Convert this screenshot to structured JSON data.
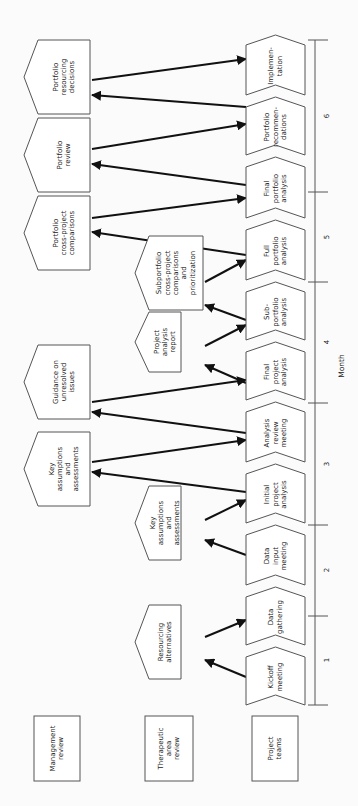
{
  "rows": [
    {
      "label_lines": [
        "Management",
        "review"
      ],
      "box": {
        "x": 34,
        "y": 716,
        "w": 46,
        "h": 65
      }
    },
    {
      "label_lines": [
        "Therapeutic",
        "area",
        "review"
      ],
      "box": {
        "x": 145,
        "y": 716,
        "w": 48,
        "h": 65
      }
    },
    {
      "label_lines": [
        "Project",
        "teams"
      ],
      "box": {
        "x": 252,
        "y": 716,
        "w": 46,
        "h": 65
      }
    }
  ],
  "steps": [
    {
      "lines": [
        "Kickoff",
        "meeting"
      ],
      "y0": 645,
      "y1": 705
    },
    {
      "lines": [
        "Data",
        "gathering"
      ],
      "y0": 585,
      "y1": 645
    },
    {
      "lines": [
        "Data",
        "input",
        "meeting"
      ],
      "y0": 523,
      "y1": 585
    },
    {
      "lines": [
        "Initial",
        "project",
        "analysis"
      ],
      "y0": 462,
      "y1": 523
    },
    {
      "lines": [
        "Analysis",
        "review",
        "meeting"
      ],
      "y0": 400,
      "y1": 462
    },
    {
      "lines": [
        "Final",
        "project",
        "analysis"
      ],
      "y0": 340,
      "y1": 400
    },
    {
      "lines": [
        "Sub-",
        "portfolio",
        "analysis"
      ],
      "y0": 280,
      "y1": 340
    },
    {
      "lines": [
        "Full",
        "portfolio",
        "analysis"
      ],
      "y0": 218,
      "y1": 280
    },
    {
      "lines": [
        "Final",
        "portfolio",
        "analysis"
      ],
      "y0": 155,
      "y1": 218
    },
    {
      "lines": [
        "Portfolio",
        "recommen-",
        "dations"
      ],
      "y0": 95,
      "y1": 155
    },
    {
      "lines": [
        "Implemen-",
        "tation"
      ],
      "y0": 33,
      "y1": 95
    }
  ],
  "outputs": [
    {
      "lines": [
        "Resourcing",
        "alternatives"
      ],
      "x": 135,
      "y": 605,
      "w": 46,
      "h": 74
    },
    {
      "lines": [
        "Key",
        "assumptions",
        "and",
        "assessments"
      ],
      "x": 135,
      "y": 486,
      "w": 46,
      "h": 74
    },
    {
      "lines": [
        "Key",
        "assumptions",
        "and",
        "assessments"
      ],
      "x": 24,
      "y": 432,
      "w": 66,
      "h": 74
    },
    {
      "lines": [
        "Guidance on",
        "unresolved",
        "issues"
      ],
      "x": 24,
      "y": 345,
      "w": 66,
      "h": 74
    },
    {
      "lines": [
        "Project",
        "analysis",
        "report"
      ],
      "x": 135,
      "y": 312,
      "w": 46,
      "h": 60
    },
    {
      "lines": [
        "Subportfolio",
        "cross-project",
        "comparisons",
        "and",
        "prioritization"
      ],
      "x": 135,
      "y": 236,
      "w": 68,
      "h": 74
    },
    {
      "lines": [
        "Portfolio",
        "cross-project",
        "comparisons"
      ],
      "x": 24,
      "y": 196,
      "w": 66,
      "h": 74
    },
    {
      "lines": [
        "Portfolio",
        "review"
      ],
      "x": 24,
      "y": 118,
      "w": 66,
      "h": 74
    },
    {
      "lines": [
        "Portfolio",
        "resourcing",
        "decisions"
      ],
      "x": 24,
      "y": 40,
      "w": 66,
      "h": 74
    }
  ],
  "arrows": [
    {
      "x1": 246,
      "y1": 677,
      "x2": 205,
      "y2": 660
    },
    {
      "x1": 205,
      "y1": 637,
      "x2": 246,
      "y2": 620
    },
    {
      "x1": 246,
      "y1": 555,
      "x2": 205,
      "y2": 540
    },
    {
      "x1": 205,
      "y1": 520,
      "x2": 246,
      "y2": 500
    },
    {
      "x1": 246,
      "y1": 492,
      "x2": 92,
      "y2": 472
    },
    {
      "x1": 92,
      "y1": 462,
      "x2": 246,
      "y2": 440
    },
    {
      "x1": 246,
      "y1": 433,
      "x2": 92,
      "y2": 412
    },
    {
      "x1": 92,
      "y1": 402,
      "x2": 246,
      "y2": 380
    },
    {
      "x1": 246,
      "y1": 383,
      "x2": 205,
      "y2": 365
    },
    {
      "x1": 205,
      "y1": 346,
      "x2": 246,
      "y2": 325
    },
    {
      "x1": 246,
      "y1": 320,
      "x2": 205,
      "y2": 305
    },
    {
      "x1": 205,
      "y1": 282,
      "x2": 246,
      "y2": 260
    },
    {
      "x1": 246,
      "y1": 255,
      "x2": 92,
      "y2": 232
    },
    {
      "x1": 92,
      "y1": 218,
      "x2": 246,
      "y2": 198
    },
    {
      "x1": 246,
      "y1": 185,
      "x2": 92,
      "y2": 164
    },
    {
      "x1": 92,
      "y1": 149,
      "x2": 246,
      "y2": 124
    },
    {
      "x1": 246,
      "y1": 107,
      "x2": 92,
      "y2": 95
    },
    {
      "x1": 92,
      "y1": 80,
      "x2": 246,
      "y2": 59
    }
  ],
  "timeline": {
    "axis_label": "Month",
    "ticks_y": [
      40,
      192,
      282,
      403,
      525,
      616,
      705
    ],
    "months": [
      {
        "label": "1",
        "y": 660
      },
      {
        "label": "2",
        "y": 570
      },
      {
        "label": "3",
        "y": 464
      },
      {
        "label": "4",
        "y": 342
      },
      {
        "label": "5",
        "y": 237
      },
      {
        "label": "6",
        "y": 116
      }
    ]
  }
}
